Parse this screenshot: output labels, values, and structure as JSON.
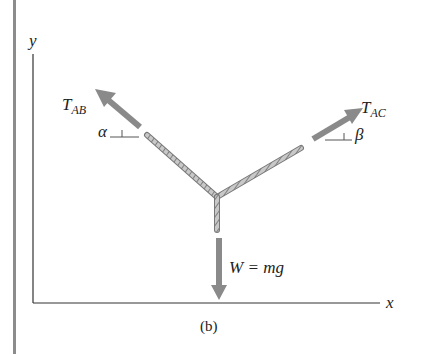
{
  "figure": {
    "caption": "(b)",
    "axes": {
      "x_label": "x",
      "y_label": "y"
    },
    "forces": {
      "tension_ab": {
        "symbol": "T",
        "subscript": "AB",
        "angle_label": "α",
        "direction": "up-left"
      },
      "tension_ac": {
        "symbol": "T",
        "subscript": "AC",
        "angle_label": "β",
        "direction": "up-right"
      },
      "weight": {
        "label": "W = mg",
        "direction": "down"
      }
    },
    "colors": {
      "arrow": "#8a8a8a",
      "rope": "#9a9a9a",
      "axis": "#333333",
      "border": "#8c8c8c",
      "text": "#222222"
    }
  }
}
